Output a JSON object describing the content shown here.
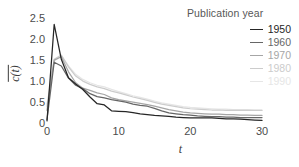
{
  "figure": {
    "background": "#ffffff"
  },
  "axes": {
    "y": {
      "label": "c(t)",
      "label_has_overbar": true,
      "ticks": [
        "0",
        "0.5",
        "1.0",
        "1.5",
        "2.0",
        "2.5"
      ],
      "tick_values": [
        0,
        0.5,
        1.0,
        1.5,
        2.0,
        2.5
      ],
      "range": [
        0,
        2.6
      ]
    },
    "x": {
      "label": "t",
      "ticks": [
        "0",
        "10",
        "20",
        "30"
      ],
      "tick_values": [
        0,
        10,
        20,
        30
      ],
      "range": [
        0,
        30
      ]
    },
    "spines": "none",
    "tickmarks": "none",
    "grid": "off"
  },
  "legend": {
    "title": "Publication year",
    "position": "top-right",
    "entries": [
      {
        "label": "1950",
        "color": "#262626"
      },
      {
        "label": "1960",
        "color": "#666666"
      },
      {
        "label": "1970",
        "color": "#a6a6a6"
      },
      {
        "label": "1980",
        "color": "#cccccc"
      },
      {
        "label": "1990",
        "color": "#e6e6e6"
      }
    ]
  },
  "chart_data": {
    "type": "line",
    "title": "",
    "subtitle": "",
    "xlabel": "t",
    "ylabel": "c(t)",
    "xlim": [
      0,
      30
    ],
    "ylim": [
      0,
      2.6
    ],
    "grid": false,
    "legend_position": "top-right",
    "legend_title": "Publication year",
    "x": [
      0,
      1,
      2,
      3,
      4,
      5,
      6,
      7,
      8,
      9,
      10,
      11,
      12,
      13,
      14,
      15,
      16,
      17,
      18,
      19,
      20,
      21,
      22,
      23,
      24,
      25,
      26,
      27,
      28,
      29,
      30
    ],
    "series": [
      {
        "name": "1950",
        "color": "#262626",
        "values": [
          0.05,
          2.35,
          1.52,
          1.08,
          0.93,
          0.8,
          0.62,
          0.46,
          0.43,
          0.29,
          0.28,
          0.27,
          0.25,
          0.22,
          0.2,
          0.18,
          0.17,
          0.16,
          0.14,
          0.13,
          0.12,
          0.12,
          0.12,
          0.12,
          0.11,
          0.1,
          0.1,
          0.09,
          0.08,
          0.07,
          0.06
        ]
      },
      {
        "name": "1960",
        "color": "#666666",
        "values": [
          0.08,
          1.45,
          1.36,
          1.07,
          0.9,
          0.82,
          0.7,
          0.63,
          0.6,
          0.56,
          0.53,
          0.5,
          0.45,
          0.42,
          0.4,
          0.35,
          0.29,
          0.24,
          0.22,
          0.2,
          0.19,
          0.17,
          0.16,
          0.15,
          0.15,
          0.14,
          0.14,
          0.13,
          0.13,
          0.13,
          0.13
        ]
      },
      {
        "name": "1970",
        "color": "#a6a6a6",
        "values": [
          0.3,
          1.5,
          1.58,
          1.22,
          0.96,
          0.83,
          0.78,
          0.72,
          0.68,
          0.6,
          0.56,
          0.53,
          0.5,
          0.47,
          0.44,
          0.4,
          0.36,
          0.32,
          0.29,
          0.26,
          0.24,
          0.23,
          0.22,
          0.21,
          0.21,
          0.2,
          0.2,
          0.19,
          0.19,
          0.18,
          0.18
        ]
      },
      {
        "name": "1980",
        "color": "#cccccc",
        "values": [
          0.4,
          1.52,
          1.62,
          1.34,
          1.12,
          1.0,
          0.92,
          0.86,
          0.82,
          0.76,
          0.72,
          0.67,
          0.62,
          0.58,
          0.54,
          0.49,
          0.45,
          0.42,
          0.39,
          0.36,
          0.34,
          0.33,
          0.32,
          0.31,
          0.31,
          0.3,
          0.3,
          0.3,
          0.3,
          0.3,
          0.3
        ]
      },
      {
        "name": "1990",
        "color": "#e6e6e6",
        "values": [
          0.45,
          1.48,
          1.6,
          1.36,
          1.16,
          1.04,
          0.96,
          0.9,
          0.86,
          0.8,
          0.75,
          0.7,
          0.65,
          0.61,
          0.57,
          0.52,
          0.48,
          0.45,
          0.42,
          0.39,
          0.37,
          0.36,
          0.35,
          0.34,
          0.33,
          0.33,
          0.32,
          0.32,
          0.32,
          0.31,
          0.31
        ]
      }
    ]
  }
}
